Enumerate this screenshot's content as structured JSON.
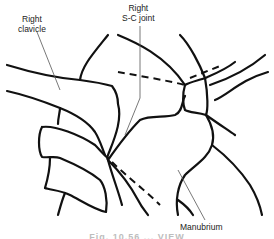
{
  "figure": {
    "type": "anatomical line drawing",
    "labels": {
      "clavicle": {
        "line1": "Right",
        "line2": "clavicle"
      },
      "sc_joint": {
        "line1": "Right",
        "line2": "S-C joint"
      },
      "manubrium": "Manubrium"
    },
    "caption": "Fig. 10.56 ... VIEW",
    "colors": {
      "line": "#111111",
      "leader": "#555555",
      "background": "#ffffff"
    }
  }
}
